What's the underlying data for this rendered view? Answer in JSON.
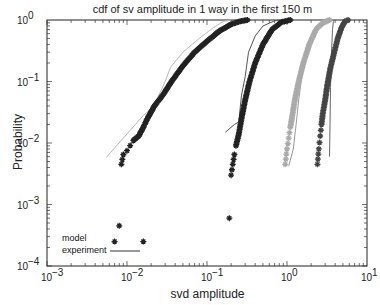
{
  "chart_data": {
    "type": "line",
    "title": "cdf of sv amplitude in 1 way in the first 150 m",
    "xlabel": "svd amplitude",
    "ylabel": "Probability",
    "xscale": "log",
    "yscale": "log",
    "xlim": [
      0.001,
      10
    ],
    "ylim": [
      0.0001,
      1
    ],
    "xticks": [
      "10^-3",
      "10^-2",
      "10^-1",
      "10^0",
      "10^1"
    ],
    "yticks": [
      "10^0",
      "10^-1",
      "10^-2",
      "10^-3",
      "10^-4"
    ],
    "grid": false,
    "legend": {
      "position": "lower left",
      "entries": [
        "model",
        "experiment"
      ]
    },
    "series": [
      {
        "name": "experiment 1",
        "style": "line",
        "color": "#bbbbbb",
        "points": [
          [
            0.0055,
            0.0058
          ],
          [
            0.009,
            0.012
          ],
          [
            0.016,
            0.028
          ],
          [
            0.022,
            0.04
          ],
          [
            0.025,
            0.06
          ],
          [
            0.03,
            0.1
          ],
          [
            0.035,
            0.17
          ],
          [
            0.05,
            0.3
          ],
          [
            0.08,
            0.5
          ],
          [
            0.12,
            0.75
          ],
          [
            0.16,
            0.95
          ],
          [
            0.2,
            1.0
          ]
        ]
      },
      {
        "name": "model 1",
        "style": "marker",
        "color": "#222222",
        "points": [
          [
            0.0085,
            0.0045
          ],
          [
            0.009,
            0.0065
          ],
          [
            0.01,
            0.0075
          ],
          [
            0.012,
            0.011
          ],
          [
            0.014,
            0.013
          ],
          [
            0.016,
            0.018
          ],
          [
            0.018,
            0.025
          ],
          [
            0.022,
            0.04
          ],
          [
            0.028,
            0.06
          ],
          [
            0.036,
            0.1
          ],
          [
            0.05,
            0.18
          ],
          [
            0.07,
            0.3
          ],
          [
            0.1,
            0.45
          ],
          [
            0.14,
            0.65
          ],
          [
            0.2,
            0.85
          ],
          [
            0.26,
            0.95
          ],
          [
            0.32,
            1.0
          ]
        ]
      },
      {
        "name": "model 1 outliers",
        "style": "marker",
        "color": "#222222",
        "points": [
          [
            0.008,
            0.00045
          ],
          [
            0.007,
            0.00025
          ],
          [
            0.016,
            0.00025
          ],
          [
            0.19,
            0.0006
          ]
        ]
      },
      {
        "name": "experiment 2",
        "style": "line",
        "color": "#555555",
        "points": [
          [
            0.17,
            0.015
          ],
          [
            0.22,
            0.02
          ],
          [
            0.25,
            0.022
          ],
          [
            0.27,
            0.06
          ],
          [
            0.3,
            0.12
          ],
          [
            0.33,
            0.3
          ],
          [
            0.4,
            0.55
          ],
          [
            0.5,
            0.8
          ],
          [
            0.7,
            0.97
          ],
          [
            0.9,
            1.0
          ]
        ]
      },
      {
        "name": "model 2",
        "style": "marker",
        "color": "#222222",
        "points": [
          [
            0.2,
            0.003
          ],
          [
            0.21,
            0.0045
          ],
          [
            0.22,
            0.0065
          ],
          [
            0.23,
            0.009
          ],
          [
            0.25,
            0.014
          ],
          [
            0.27,
            0.025
          ],
          [
            0.3,
            0.05
          ],
          [
            0.34,
            0.1
          ],
          [
            0.4,
            0.2
          ],
          [
            0.5,
            0.4
          ],
          [
            0.65,
            0.7
          ],
          [
            0.85,
            0.92
          ],
          [
            1.1,
            1.0
          ]
        ]
      },
      {
        "name": "experiment 3",
        "style": "line",
        "color": "#999999",
        "points": [
          [
            1.05,
            0.0042
          ],
          [
            1.2,
            0.008
          ],
          [
            1.3,
            0.02
          ],
          [
            1.4,
            0.05
          ],
          [
            1.5,
            0.1
          ],
          [
            1.7,
            0.25
          ],
          [
            2.0,
            0.5
          ],
          [
            2.4,
            0.8
          ],
          [
            2.8,
            1.0
          ]
        ]
      },
      {
        "name": "model 3",
        "style": "marker",
        "color": "#aaaaaa",
        "points": [
          [
            0.95,
            0.0045
          ],
          [
            1.0,
            0.008
          ],
          [
            1.05,
            0.012
          ],
          [
            1.1,
            0.018
          ],
          [
            1.15,
            0.025
          ],
          [
            1.25,
            0.05
          ],
          [
            1.4,
            0.1
          ],
          [
            1.6,
            0.2
          ],
          [
            1.9,
            0.4
          ],
          [
            2.3,
            0.7
          ],
          [
            2.8,
            0.9
          ],
          [
            3.4,
            1.0
          ]
        ]
      },
      {
        "name": "experiment 4",
        "style": "line",
        "color": "#666666",
        "points": [
          [
            3.4,
            0.006
          ],
          [
            3.45,
            0.02
          ],
          [
            3.5,
            0.08
          ],
          [
            3.6,
            0.3
          ],
          [
            3.7,
            0.7
          ],
          [
            3.8,
            0.95
          ],
          [
            3.9,
            1.0
          ]
        ]
      },
      {
        "name": "model 4",
        "style": "marker",
        "color": "#444444",
        "points": [
          [
            2.4,
            0.0045
          ],
          [
            2.5,
            0.008
          ],
          [
            2.6,
            0.013
          ],
          [
            2.7,
            0.02
          ],
          [
            2.8,
            0.03
          ],
          [
            3.0,
            0.05
          ],
          [
            3.2,
            0.09
          ],
          [
            3.5,
            0.17
          ],
          [
            3.9,
            0.3
          ],
          [
            4.3,
            0.5
          ],
          [
            4.8,
            0.75
          ],
          [
            5.3,
            0.95
          ],
          [
            5.8,
            1.0
          ]
        ]
      }
    ]
  }
}
